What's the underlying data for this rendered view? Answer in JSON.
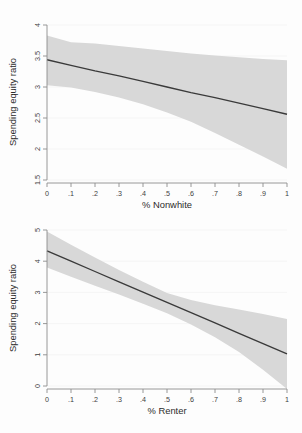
{
  "figure": {
    "background_color": "#fdfdfd",
    "band_color": "#d8d8d8",
    "line_color": "#3a3a3a",
    "axis_color": "#8c8c8c"
  },
  "chart_data": [
    {
      "type": "line",
      "panel": "top",
      "title": "",
      "xlabel": "% Nonwhite",
      "ylabel": "Spending equity ratio",
      "xlim": [
        0,
        1
      ],
      "ylim": [
        1.5,
        4
      ],
      "grid": false,
      "legend": "none",
      "xticks": [
        0,
        0.1,
        0.2,
        0.3,
        0.4,
        0.5,
        0.6,
        0.7,
        0.8,
        0.9,
        1
      ],
      "xticklabels": [
        "0",
        ".1",
        ".2",
        ".3",
        ".4",
        ".5",
        ".6",
        ".7",
        ".8",
        ".9",
        "1"
      ],
      "yticks": [
        1.5,
        2,
        2.5,
        3,
        3.5,
        4
      ],
      "yticklabels": [
        "1.5",
        "2",
        "2.5",
        "3",
        "3.5",
        "4"
      ],
      "x": [
        0,
        0.1,
        0.2,
        0.3,
        0.4,
        0.5,
        0.6,
        0.7,
        0.8,
        0.9,
        1
      ],
      "series": [
        {
          "name": "Predicted spending equity ratio",
          "values": [
            3.44,
            3.35,
            3.26,
            3.18,
            3.09,
            3.0,
            2.91,
            2.83,
            2.74,
            2.65,
            2.56
          ]
        },
        {
          "name": "95% CI upper",
          "values": [
            3.83,
            3.72,
            3.7,
            3.66,
            3.62,
            3.58,
            3.54,
            3.51,
            3.48,
            3.45,
            3.43
          ]
        },
        {
          "name": "95% CI lower",
          "values": [
            3.03,
            2.99,
            2.92,
            2.83,
            2.72,
            2.59,
            2.44,
            2.26,
            2.07,
            1.88,
            1.68
          ]
        }
      ]
    },
    {
      "type": "line",
      "panel": "bottom",
      "title": "",
      "xlabel": "% Renter",
      "ylabel": "Spending equity ratio",
      "xlim": [
        0,
        1
      ],
      "ylim": [
        0,
        5
      ],
      "grid": false,
      "legend": "none",
      "xticks": [
        0,
        0.1,
        0.2,
        0.3,
        0.4,
        0.5,
        0.6,
        0.7,
        0.8,
        0.9,
        1
      ],
      "xticklabels": [
        "0",
        ".1",
        ".2",
        ".3",
        ".4",
        ".5",
        ".6",
        ".7",
        ".8",
        ".9",
        "1"
      ],
      "yticks": [
        0,
        1,
        2,
        3,
        4,
        5
      ],
      "yticklabels": [
        "0",
        "1",
        "2",
        "3",
        "4",
        "5"
      ],
      "x": [
        0,
        0.1,
        0.2,
        0.3,
        0.4,
        0.5,
        0.6,
        0.7,
        0.8,
        0.9,
        1
      ],
      "series": [
        {
          "name": "Predicted spending equity ratio",
          "values": [
            4.33,
            4.0,
            3.67,
            3.34,
            3.01,
            2.68,
            2.35,
            2.02,
            1.69,
            1.36,
            1.03
          ]
        },
        {
          "name": "95% CI upper",
          "values": [
            4.95,
            4.53,
            4.12,
            3.72,
            3.34,
            2.98,
            2.76,
            2.59,
            2.45,
            2.31,
            2.15
          ]
        },
        {
          "name": "95% CI lower",
          "values": [
            3.8,
            3.5,
            3.21,
            2.93,
            2.64,
            2.33,
            1.97,
            1.56,
            1.09,
            0.52,
            -0.1
          ]
        }
      ]
    }
  ]
}
